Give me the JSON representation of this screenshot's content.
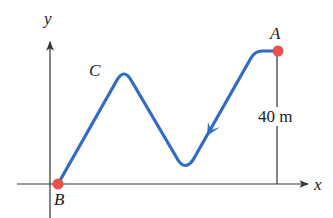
{
  "diagram": {
    "type": "trajectory-on-axes",
    "axes": {
      "x_label": "x",
      "y_label": "y"
    },
    "points": [
      {
        "id": "A",
        "label": "A",
        "description": "start point, upper right, marked with red dot"
      },
      {
        "id": "B",
        "label": "B",
        "description": "end point at origin region on x-axis, marked with red dot"
      },
      {
        "id": "C",
        "label": "C",
        "description": "peak of the path on the left"
      }
    ],
    "height_annotation": {
      "label": "40 m",
      "description": "vertical distance from A down to x-axis"
    },
    "path": {
      "description": "blue curve from A down to a valley, up to peak C, then down to B; arrow indicates direction of travel from A toward B",
      "direction": "A to B"
    },
    "colors": {
      "path": "#2f6cc7",
      "point": "#e8524a",
      "axis": "#333333",
      "text": "#1a1a1a",
      "background": "#ffffff"
    }
  }
}
